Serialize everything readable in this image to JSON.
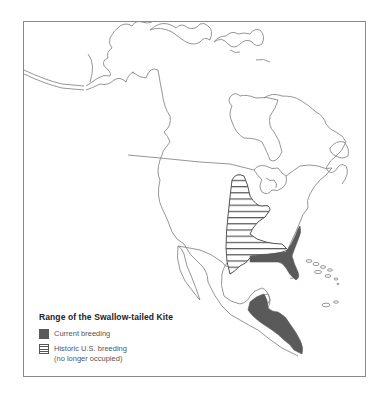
{
  "map": {
    "title": "Range of the Swallow-tailed Kite",
    "region": "North and Central America",
    "colors": {
      "current_breeding": "#5a5a5a",
      "historic_hatch": "#555555",
      "coastline": "#8a8a8a",
      "frame": "#8a8a8a"
    }
  },
  "legend": {
    "title": "Range of the Swallow-tailed Kite",
    "items": [
      {
        "swatch": "solid-dark-gray",
        "label": "Current breeding"
      },
      {
        "swatch": "horizontal-hatch",
        "label_line1": "Historic U.S. breeding",
        "label_line2": "(no longer occupied)"
      }
    ]
  }
}
